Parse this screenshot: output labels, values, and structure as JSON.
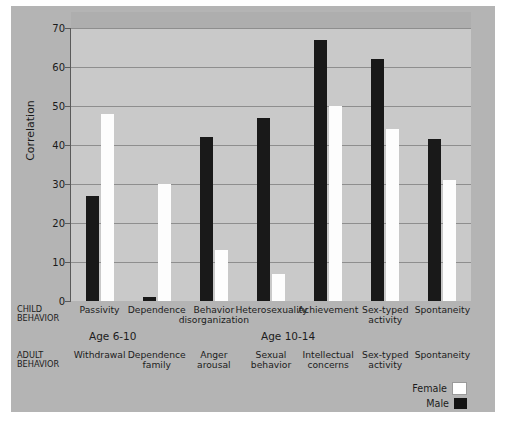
{
  "chart_data": {
    "type": "bar",
    "title": "",
    "xlabel": "",
    "ylabel": "Correlation",
    "ylim": [
      0,
      70
    ],
    "yticks": [
      0,
      10,
      20,
      30,
      40,
      50,
      60,
      70
    ],
    "grid": true,
    "legend_position": "bottom-right",
    "categories": [
      "Passivity",
      "Dependence",
      "Behavior disorganization",
      "Heterosexuality",
      "Achievement",
      "Sex-typed activity",
      "Spontaneity"
    ],
    "series": [
      {
        "name": "Female",
        "color": "#ffffff",
        "values": [
          48,
          30,
          13,
          7,
          50,
          44,
          31
        ]
      },
      {
        "name": "Male",
        "color": "#141414",
        "values": [
          27,
          1,
          42,
          47,
          67,
          62,
          41.5
        ]
      }
    ],
    "annotations": {
      "child_behavior_tag": "CHILD BEHAVIOR",
      "adult_behavior_tag": "ADULT BEHAVIOR",
      "age_groups": [
        "Age 6-10",
        "Age 10-14"
      ],
      "adult_behavior_labels": [
        "Withdrawal",
        "Dependence family",
        "Anger arousal",
        "Sexual behavior",
        "Intellectual concerns",
        "Sex-typed activity",
        "Spontaneity"
      ]
    }
  },
  "axis": {
    "y_label": "Correlation",
    "y_ticks": [
      "70",
      "60",
      "50",
      "40",
      "30",
      "20",
      "10",
      "0"
    ]
  },
  "child_behavior": {
    "tag_line1": "CHILD",
    "tag_line2": "BEHAVIOR",
    "labels": [
      {
        "line1": "Passivity",
        "line2": ""
      },
      {
        "line1": "Dependence",
        "line2": ""
      },
      {
        "line1": "Behavior",
        "line2": "disorganization"
      },
      {
        "line1": "Heterosexuality",
        "line2": ""
      },
      {
        "line1": "Achievement",
        "line2": ""
      },
      {
        "line1": "Sex-typed",
        "line2": "activity"
      },
      {
        "line1": "Spontaneity",
        "line2": ""
      }
    ]
  },
  "adult_behavior": {
    "tag_line1": "ADULT",
    "tag_line2": "BEHAVIOR",
    "labels": [
      {
        "line1": "Withdrawal",
        "line2": ""
      },
      {
        "line1": "Dependence",
        "line2": "family"
      },
      {
        "line1": "Anger",
        "line2": "arousal"
      },
      {
        "line1": "Sexual",
        "line2": "behavior"
      },
      {
        "line1": "Intellectual",
        "line2": "concerns"
      },
      {
        "line1": "Sex-typed",
        "line2": "activity"
      },
      {
        "line1": "Spontaneity",
        "line2": ""
      }
    ]
  },
  "age_bands": [
    {
      "label": "Age 6-10"
    },
    {
      "label": "Age 10-14"
    }
  ],
  "legend": {
    "female_label": "Female",
    "male_label": "Male"
  }
}
